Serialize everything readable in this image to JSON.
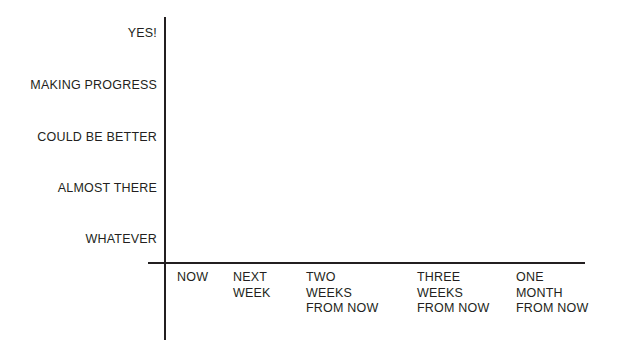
{
  "chart_data": {
    "type": "line",
    "title": "",
    "subtitle": "",
    "xlabel": "",
    "ylabel": "",
    "grid": false,
    "legend": false,
    "note": "Empty plot area - no data series are drawn; both axes show only category labels.",
    "series": [],
    "categories": [
      "NOW",
      "NEXT WEEK",
      "TWO WEEKS FROM NOW",
      "THREE WEEKS FROM NOW",
      "ONE MONTH FROM NOW"
    ],
    "y_categories": [
      "WHATEVER",
      "ALMOST THERE",
      "COULD BE BETTER",
      "MAKING PROGRESS",
      "YES!"
    ]
  },
  "axes": {
    "y_ticks": [
      {
        "label": "YES!",
        "top": 33
      },
      {
        "label": "MAKING PROGRESS",
        "top": 85
      },
      {
        "label": "COULD BE BETTER",
        "top": 137
      },
      {
        "label": "ALMOST THERE",
        "top": 188
      },
      {
        "label": "WHATEVER",
        "top": 239
      }
    ],
    "x_ticks": [
      {
        "left": 177,
        "lines": [
          "NOW"
        ]
      },
      {
        "left": 233,
        "lines": [
          "NEXT",
          "WEEK"
        ]
      },
      {
        "left": 306,
        "lines": [
          "TWO",
          "WEEKS",
          "FROM NOW"
        ]
      },
      {
        "left": 417,
        "lines": [
          "THREE",
          "WEEKS",
          "FROM NOW"
        ]
      },
      {
        "left": 516,
        "lines": [
          "ONE",
          "MONTH",
          "FROM NOW"
        ]
      }
    ]
  },
  "style": {
    "ink": "#231f20",
    "background": "#ffffff"
  }
}
